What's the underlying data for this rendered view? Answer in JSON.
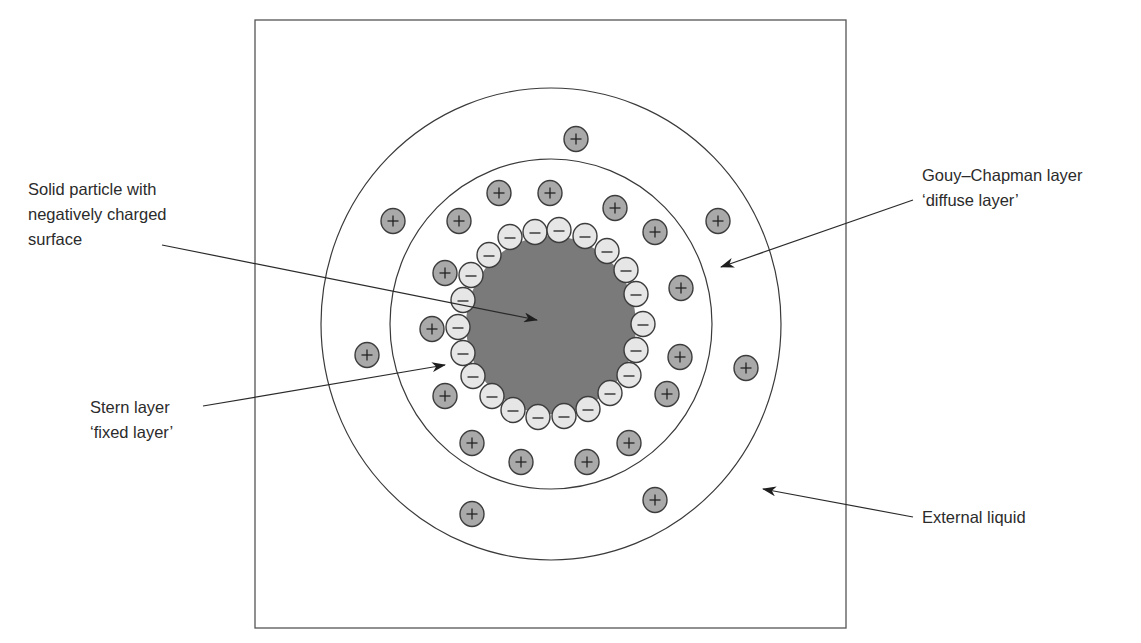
{
  "figure": {
    "colors": {
      "line": "#3a3a3a",
      "particle_fill": "#7a7a7a",
      "anion_fill": "#e6e6e6",
      "cation_fill": "#a9a9a9",
      "background": "#ffffff"
    },
    "frame": {
      "x": 255,
      "y": 20,
      "w": 591,
      "h": 608
    },
    "outer_ellipse": {
      "cx": 551,
      "cy": 324,
      "rx": 230,
      "ry": 236,
      "name": "Gouy-Chapman diffuse layer boundary"
    },
    "inner_ellipse": {
      "cx": 551,
      "cy": 324,
      "rx": 161,
      "ry": 165,
      "name": "Stern layer boundary"
    },
    "particle": {
      "cx": 551,
      "cy": 325,
      "rx": 85,
      "ry": 89
    },
    "ion_radius": 12,
    "anion_symbol": "−",
    "cation_symbol": "+",
    "anions": [
      [
        510,
        237
      ],
      [
        535,
        232
      ],
      [
        559,
        230
      ],
      [
        585,
        236
      ],
      [
        607,
        251
      ],
      [
        626,
        270
      ],
      [
        636,
        294
      ],
      [
        643,
        324
      ],
      [
        636,
        350
      ],
      [
        629,
        375
      ],
      [
        610,
        393
      ],
      [
        588,
        409
      ],
      [
        564,
        416
      ],
      [
        538,
        417
      ],
      [
        513,
        410
      ],
      [
        492,
        396
      ],
      [
        473,
        376
      ],
      [
        463,
        353
      ],
      [
        458,
        327
      ],
      [
        463,
        300
      ],
      [
        471,
        275
      ],
      [
        489,
        255
      ]
    ],
    "cations": [
      [
        576,
        139
      ],
      [
        499,
        193
      ],
      [
        550,
        193
      ],
      [
        615,
        208
      ],
      [
        393,
        221
      ],
      [
        459,
        221
      ],
      [
        655,
        232
      ],
      [
        718,
        221
      ],
      [
        445,
        273
      ],
      [
        681,
        288
      ],
      [
        432,
        329
      ],
      [
        367,
        355
      ],
      [
        680,
        357
      ],
      [
        746,
        368
      ],
      [
        445,
        396
      ],
      [
        667,
        394
      ],
      [
        472,
        443
      ],
      [
        629,
        443
      ],
      [
        521,
        462
      ],
      [
        587,
        462
      ],
      [
        655,
        500
      ],
      [
        472,
        514
      ]
    ]
  },
  "labels": {
    "solid_particle": {
      "lines": [
        "Solid particle with",
        "negatively charged",
        "surface"
      ],
      "x": 28,
      "y": 177,
      "arrow": {
        "x1": 162,
        "y1": 245,
        "x2": 537,
        "y2": 320
      }
    },
    "stern": {
      "lines": [
        "Stern layer",
        "‘fixed layer’"
      ],
      "x": 90,
      "y": 395,
      "arrow": {
        "x1": 203,
        "y1": 406,
        "x2": 445,
        "y2": 365
      }
    },
    "gouy": {
      "lines": [
        "Gouy–Chapman layer",
        "‘diffuse layer’"
      ],
      "x": 922,
      "y": 163,
      "arrow": {
        "x1": 913,
        "y1": 200,
        "x2": 721,
        "y2": 267
      }
    },
    "external": {
      "lines": [
        "External liquid"
      ],
      "x": 922,
      "y": 505,
      "arrow": {
        "x1": 913,
        "y1": 517,
        "x2": 763,
        "y2": 489
      }
    }
  }
}
